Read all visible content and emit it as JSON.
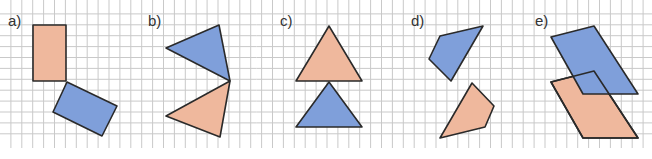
{
  "colors": {
    "orange_fill": "#EFB89D",
    "blue_fill": "#7F9FDA",
    "stroke": "#2a2a2a",
    "grid": "#c9c9c9",
    "background": "#ffffff"
  },
  "grid": {
    "x0": 0,
    "y0": 3,
    "spacing": 10.9,
    "bottom": 148
  },
  "panels": [
    {
      "label": "a)",
      "label_pos": [
        8,
        26
      ],
      "shapes": [
        {
          "name": "orange-rectangle",
          "color": "orange",
          "points": [
            [
              33,
              25
            ],
            [
              66,
              25
            ],
            [
              66,
              81
            ],
            [
              33,
              81
            ]
          ]
        },
        {
          "name": "blue-rectangle",
          "color": "blue",
          "points": [
            [
              67,
              82
            ],
            [
              117,
              106
            ],
            [
              102,
              136
            ],
            [
              53,
              112
            ]
          ]
        }
      ]
    },
    {
      "label": "b)",
      "label_pos": [
        148,
        26
      ],
      "shapes": [
        {
          "name": "blue-triangle",
          "color": "blue",
          "points": [
            [
              219,
              25
            ],
            [
              166,
              48
            ],
            [
              230,
              81
            ]
          ]
        },
        {
          "name": "orange-triangle",
          "color": "orange",
          "points": [
            [
              230,
              81
            ],
            [
              166,
              116
            ],
            [
              220,
              137
            ]
          ]
        }
      ]
    },
    {
      "label": "c)",
      "label_pos": [
        280,
        26
      ],
      "shapes": [
        {
          "name": "orange-triangle",
          "color": "orange",
          "points": [
            [
              329,
              26
            ],
            [
              296,
              81
            ],
            [
              362,
              81
            ]
          ]
        },
        {
          "name": "blue-triangle",
          "color": "blue",
          "points": [
            [
              329,
              82
            ],
            [
              296,
              127
            ],
            [
              362,
              127
            ]
          ]
        }
      ]
    },
    {
      "label": "d)",
      "label_pos": [
        411,
        26
      ],
      "shapes": [
        {
          "name": "blue-quadrilateral",
          "color": "blue",
          "points": [
            [
              440,
              36
            ],
            [
              483,
              26
            ],
            [
              451,
              81
            ],
            [
              429,
              59
            ]
          ]
        },
        {
          "name": "orange-quadrilateral",
          "color": "orange",
          "points": [
            [
              472,
              83
            ],
            [
              494,
              106
            ],
            [
              485,
              127
            ],
            [
              440,
              138
            ]
          ]
        }
      ]
    },
    {
      "label": "e)",
      "label_pos": [
        535,
        26
      ],
      "shapes": [
        {
          "name": "orange-parallelogram",
          "color": "orange",
          "points": [
            [
              551,
              82
            ],
            [
              594,
              71
            ],
            [
              638,
              138
            ],
            [
              583,
              138
            ]
          ]
        },
        {
          "name": "blue-parallelogram",
          "color": "blue",
          "points": [
            [
              551,
              37
            ],
            [
              594,
              26
            ],
            [
              638,
              94
            ],
            [
              583,
              94
            ]
          ]
        },
        {
          "name": "orange-parallelogram-outline",
          "color": "none",
          "points": [
            [
              551,
              82
            ],
            [
              594,
              71
            ],
            [
              638,
              138
            ],
            [
              583,
              138
            ]
          ]
        }
      ]
    }
  ]
}
